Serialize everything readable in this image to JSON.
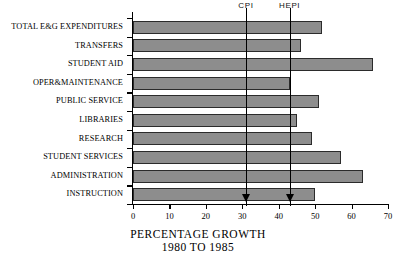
{
  "chart_data": {
    "type": "bar",
    "orientation": "horizontal",
    "title": "PERCENTAGE GROWTH",
    "subtitle": "1980 TO 1985",
    "xlabel": "PERCENTAGE GROWTH 1980 TO 1985",
    "ylabel": "",
    "xlim": [
      0,
      70
    ],
    "xticks": [
      0,
      10,
      20,
      30,
      40,
      50,
      60,
      70
    ],
    "grid": false,
    "legend": "none",
    "bar_color": "#8d8d8d",
    "bar_edge_color": "#2b2b2b",
    "categories": [
      "TOTAL E&G EXPENDITURES",
      "TRANSFERS",
      "STUDENT AID",
      "OPER&MAINTENANCE",
      "PUBLIC SERVICE",
      "LIBRARIES",
      "RESEARCH",
      "STUDENT SERVICES",
      "ADMINISTRATION",
      "INSTRUCTION"
    ],
    "values": [
      52,
      46,
      66,
      43,
      51,
      45,
      49,
      57,
      63,
      50
    ],
    "annotations": [
      {
        "label": "CPI",
        "value": 31
      },
      {
        "label": "HEPI",
        "value": 43
      }
    ]
  }
}
